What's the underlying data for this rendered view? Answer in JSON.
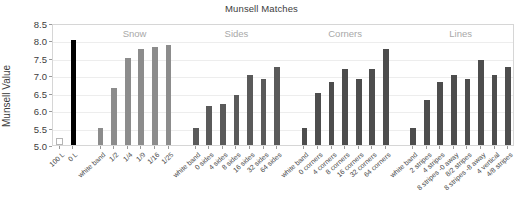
{
  "chart_data": {
    "type": "bar",
    "title": "Munsell Matches",
    "xlabel": "",
    "ylabel": "Munsell Value",
    "ylim": [
      5.0,
      8.5
    ],
    "ytick_labels": [
      "5.0",
      "5.5",
      "6.0",
      "6.5",
      "7.0",
      "7.5",
      "8.0",
      "8.5"
    ],
    "ytick_values": [
      5.0,
      5.5,
      6.0,
      6.5,
      7.0,
      7.5,
      8.0,
      8.5
    ],
    "grid": true,
    "legend": "none",
    "group_labels": [
      "Snow",
      "Sides",
      "Corners",
      "Lines"
    ],
    "categories": [
      "100 L",
      "0 L",
      "white band",
      "1/2",
      "1/4",
      "1/9",
      "1/16",
      "1/25",
      "white band",
      "0 sides",
      "4 sides",
      "8 sides",
      "16 sides",
      "32 sides",
      "64 sides",
      "white band",
      "0 corners",
      "4 corners",
      "8 corners",
      "16 corners",
      "32 corners",
      "64 corners",
      "white band",
      "2 stripes",
      "4 stripes",
      "8 stripes -0 away",
      "8/2 stripes",
      "8 stripes -8 away",
      "4 vertical",
      "4/8 stripes"
    ],
    "values": [
      5.02,
      8.0,
      5.48,
      6.63,
      7.5,
      7.75,
      7.82,
      7.86,
      5.48,
      6.13,
      6.18,
      6.43,
      7.0,
      6.88,
      7.25,
      5.48,
      6.5,
      6.8,
      7.18,
      6.88,
      7.18,
      7.75,
      5.48,
      6.3,
      6.8,
      7.0,
      6.88,
      7.45,
      7.0,
      7.25
    ],
    "bar_colors": [
      "#ffffff",
      "#000000",
      "#8c8c8c",
      "#8c8c8c",
      "#8c8c8c",
      "#8c8c8c",
      "#8c8c8c",
      "#8c8c8c",
      "#5a5a5a",
      "#5a5a5a",
      "#5a5a5a",
      "#5a5a5a",
      "#5a5a5a",
      "#5a5a5a",
      "#5a5a5a",
      "#4d4d4d",
      "#4d4d4d",
      "#4d4d4d",
      "#4d4d4d",
      "#4d4d4d",
      "#4d4d4d",
      "#4d4d4d",
      "#4d4d4d",
      "#4d4d4d",
      "#4d4d4d",
      "#4d4d4d",
      "#4d4d4d",
      "#4d4d4d",
      "#4d4d4d",
      "#4d4d4d"
    ],
    "groups": [
      {
        "label": "",
        "count": 2
      },
      {
        "label": "Snow",
        "count": 6
      },
      {
        "label": "Sides",
        "count": 7
      },
      {
        "label": "Corners",
        "count": 7
      },
      {
        "label": "Lines",
        "count": 8
      }
    ],
    "colors": {
      "frame": "#d6d6d6",
      "grid": "#ededed",
      "text": "#3d3d3d",
      "group_header": "#a8a8a8",
      "background": "#ffffff"
    }
  }
}
